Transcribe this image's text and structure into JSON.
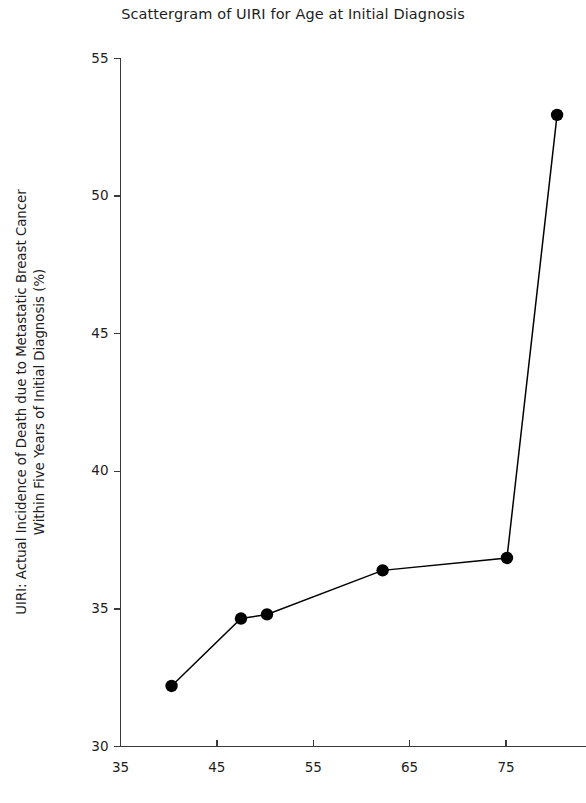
{
  "chart_data": {
    "type": "line",
    "title": "Scattergram of UIRI for Age at Initial Diagnosis",
    "xlabel": "",
    "ylabel": "UIRI: Actual Incidence of Death due to Metastatic Breast Cancer Within Five Years of Initial Diagnosis (%)",
    "ylabel_lines": [
      "UIRI: Actual Incidence of Death due to Metastatic Breast Cancer",
      "Within Five Years of Initial Diagnosis (%)"
    ],
    "xlim": [
      35,
      83
    ],
    "ylim": [
      30,
      55
    ],
    "xticks": [
      35,
      45,
      55,
      65,
      75
    ],
    "yticks": [
      30,
      35,
      40,
      45,
      50,
      55
    ],
    "xtick_labels": [
      "35",
      "45",
      "55",
      "65",
      "75"
    ],
    "ytick_labels": [
      "30",
      "35",
      "40",
      "45",
      "50",
      "55"
    ],
    "grid": false,
    "legend": "none",
    "marker": "filled-circle",
    "marker_color": "#000000",
    "line_color": "#000000",
    "axis_color": "#3a3a3a",
    "series": [
      {
        "name": "UIRI vs Age at Initial Diagnosis",
        "x": [
          40.3,
          47.5,
          50.2,
          62.2,
          75.1,
          80.3
        ],
        "y": [
          32.2,
          34.65,
          34.8,
          36.4,
          36.85,
          52.95
        ]
      }
    ]
  }
}
